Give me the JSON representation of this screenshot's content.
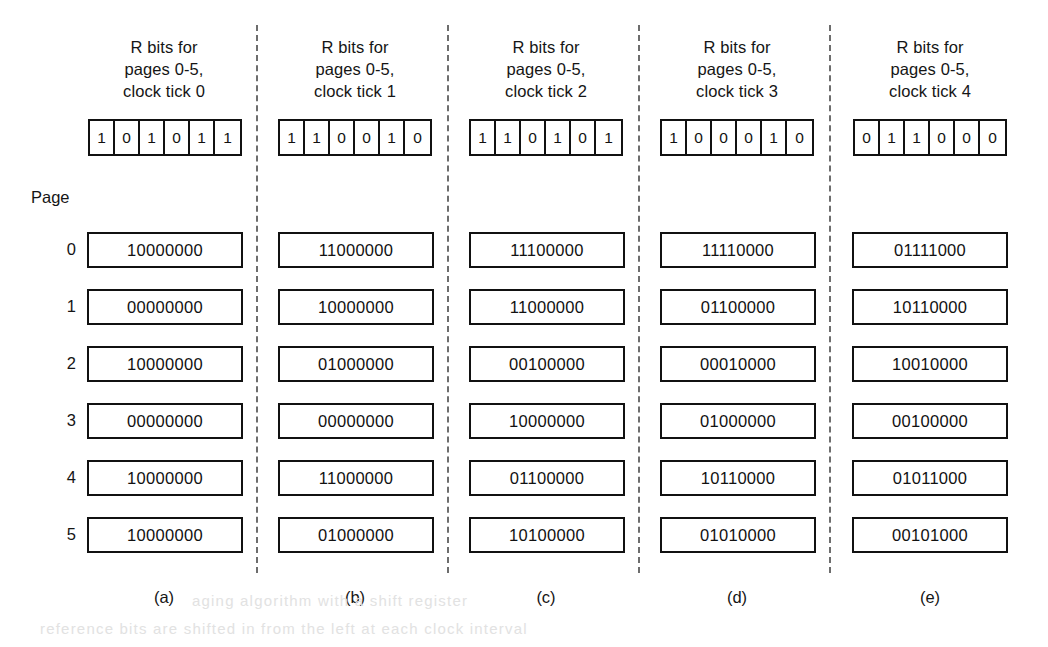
{
  "figure": {
    "page_axis_label": "Page",
    "page_indices": [
      "0",
      "1",
      "2",
      "3",
      "4",
      "5"
    ],
    "header_line1": "R bits for",
    "header_line2": "pages 0-5,",
    "columns": [
      {
        "id": "a",
        "footer": "(a)",
        "header_line3": "clock tick 0",
        "r_bits": [
          "1",
          "0",
          "1",
          "0",
          "1",
          "1"
        ],
        "counters": [
          "10000000",
          "00000000",
          "10000000",
          "00000000",
          "10000000",
          "10000000"
        ]
      },
      {
        "id": "b",
        "footer": "(b)",
        "header_line3": "clock tick 1",
        "r_bits": [
          "1",
          "1",
          "0",
          "0",
          "1",
          "0"
        ],
        "counters": [
          "11000000",
          "10000000",
          "01000000",
          "00000000",
          "11000000",
          "01000000"
        ]
      },
      {
        "id": "c",
        "footer": "(c)",
        "header_line3": "clock tick 2",
        "r_bits": [
          "1",
          "1",
          "0",
          "1",
          "0",
          "1"
        ],
        "counters": [
          "11100000",
          "11000000",
          "00100000",
          "10000000",
          "01100000",
          "10100000"
        ]
      },
      {
        "id": "d",
        "footer": "(d)",
        "header_line3": "clock tick 3",
        "r_bits": [
          "1",
          "0",
          "0",
          "0",
          "1",
          "0"
        ],
        "counters": [
          "11110000",
          "01100000",
          "00010000",
          "01000000",
          "10110000",
          "01010000"
        ]
      },
      {
        "id": "e",
        "footer": "(e)",
        "header_line3": "clock tick 4",
        "r_bits": [
          "0",
          "1",
          "1",
          "0",
          "0",
          "0"
        ],
        "counters": [
          "01111000",
          "10110000",
          "10010000",
          "00100000",
          "01011000",
          "00101000"
        ]
      }
    ]
  }
}
